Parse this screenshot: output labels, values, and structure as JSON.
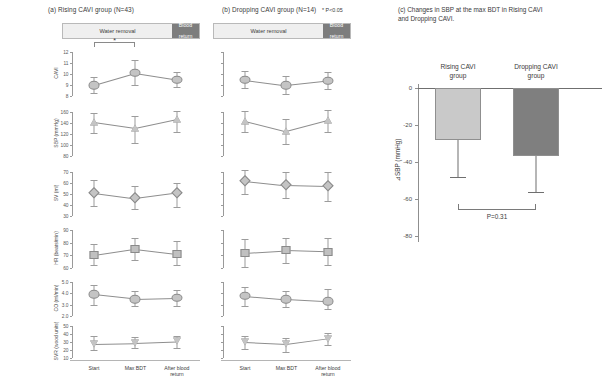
{
  "figure": {
    "panel_a_title": "(a) Rising CAVI group (N=43)",
    "panel_b_title": "(b) Dropping CAVI group (N=14)",
    "panel_c_title": "(c) Changes in SBP at the max  BDT in Rising CAVI and Dropping CAVI.",
    "significance_note": "* P<0.05",
    "phase_water_label": "Water removal",
    "phase_blood_label_line1": "Blood",
    "phase_blood_label_line2": "return",
    "sig_star": "*"
  },
  "x_labels": [
    "Start",
    "Max BDT",
    "After blood\nreturn"
  ],
  "chart_data": [
    {
      "type": "line",
      "title": "(a) Rising CAVI group (N=43)",
      "xlabel": "",
      "x": [
        "Start",
        "Max BDT",
        "After blood return"
      ],
      "grid": false,
      "legend": "none",
      "rows": [
        {
          "ylabel": "CAVI",
          "ylim": [
            8,
            12
          ],
          "ticks": [
            8,
            9,
            10,
            11,
            12
          ],
          "ticklabels": [
            "8",
            "9",
            "10",
            "11",
            "12"
          ],
          "marker": "circle",
          "values": [
            9.0,
            10.1,
            9.5
          ],
          "err_low": [
            8.3,
            9.0,
            8.8
          ],
          "err_high": [
            9.7,
            11.3,
            10.2
          ],
          "significance": {
            "from": 0,
            "to": 1,
            "label": "*"
          }
        },
        {
          "ylabel": "SBP (mmHg)",
          "ylim": [
            80,
            160
          ],
          "ticks": [
            80,
            100,
            120,
            140,
            160
          ],
          "ticklabels": [
            "80",
            "100",
            "120",
            "140",
            "160"
          ],
          "marker": "triangle",
          "values": [
            142,
            131,
            147
          ],
          "err_low": [
            121,
            104,
            124
          ],
          "err_high": [
            159,
            152,
            162
          ]
        },
        {
          "ylabel": "SV (ml)",
          "ylim": [
            30,
            70
          ],
          "ticks": [
            30,
            40,
            50,
            60,
            70
          ],
          "ticklabels": [
            "30",
            "40",
            "50",
            "60",
            "70"
          ],
          "marker": "diamond",
          "values": [
            51,
            46,
            51
          ],
          "err_low": [
            39,
            36,
            38
          ],
          "err_high": [
            63,
            57,
            60
          ]
        },
        {
          "ylabel": "HR (beats/min)",
          "ylim": [
            60,
            90
          ],
          "ticks": [
            60,
            70,
            80,
            90
          ],
          "ticklabels": [
            "60",
            "70",
            "80",
            "90"
          ],
          "marker": "square",
          "values": [
            70,
            75,
            71
          ],
          "err_low": [
            62,
            66,
            62
          ],
          "err_high": [
            79,
            84,
            81
          ]
        },
        {
          "ylabel": "CO (ml/min)",
          "ylim": [
            2.0,
            5.0
          ],
          "ticks": [
            2.0,
            3.0,
            4.0,
            5.0
          ],
          "ticklabels": [
            "2.0",
            "3.0",
            "4.0",
            "5.0"
          ],
          "marker": "circle",
          "values": [
            3.9,
            3.5,
            3.6
          ],
          "err_low": [
            3.0,
            2.9,
            2.9
          ],
          "err_high": [
            4.7,
            4.2,
            4.3
          ]
        },
        {
          "ylabel": "SVR (wood units)",
          "ylim": [
            10,
            50
          ],
          "ticks": [
            10,
            20,
            30,
            40,
            50
          ],
          "ticklabels": [
            "10",
            "20",
            "30",
            "40",
            "50"
          ],
          "marker": "down-triangle",
          "values": [
            28,
            29,
            31
          ],
          "err_low": [
            20,
            22,
            23
          ],
          "err_high": [
            37,
            36,
            38
          ]
        }
      ]
    },
    {
      "type": "line",
      "title": "(b) Dropping CAVI group (N=14)",
      "xlabel": "",
      "x": [
        "Start",
        "Max BDT",
        "After blood return"
      ],
      "grid": false,
      "legend": "none",
      "rows": [
        {
          "ylabel": "CAVI",
          "ylim": [
            8,
            12
          ],
          "ticks": [
            8,
            9,
            10,
            11,
            12
          ],
          "marker": "circle",
          "values": [
            9.5,
            9.0,
            9.4
          ],
          "err_low": [
            8.7,
            8.2,
            8.6
          ],
          "err_high": [
            10.3,
            9.8,
            10.2
          ]
        },
        {
          "ylabel": "SBP (mmHg)",
          "ylim": [
            80,
            160
          ],
          "ticks": [
            80,
            100,
            120,
            140,
            160
          ],
          "marker": "triangle",
          "values": [
            144,
            125,
            145
          ],
          "err_low": [
            123,
            101,
            124
          ],
          "err_high": [
            162,
            148,
            163
          ]
        },
        {
          "ylabel": "SV (ml)",
          "ylim": [
            30,
            70
          ],
          "ticks": [
            30,
            40,
            50,
            60,
            70
          ],
          "marker": "diamond",
          "values": [
            62,
            58,
            57
          ],
          "err_low": [
            50,
            46,
            44
          ],
          "err_high": [
            72,
            70,
            70
          ]
        },
        {
          "ylabel": "HR (beats/min)",
          "ylim": [
            60,
            90
          ],
          "ticks": [
            60,
            70,
            80,
            90
          ],
          "marker": "square",
          "values": [
            72,
            74,
            73
          ],
          "err_low": [
            61,
            64,
            62
          ],
          "err_high": [
            83,
            84,
            84
          ]
        },
        {
          "ylabel": "CO (ml/min)",
          "ylim": [
            2.0,
            5.0
          ],
          "ticks": [
            2.0,
            3.0,
            4.0,
            5.0
          ],
          "marker": "circle",
          "values": [
            3.8,
            3.5,
            3.3
          ],
          "err_low": [
            2.9,
            2.8,
            2.6
          ],
          "err_high": [
            4.6,
            4.2,
            4.4
          ]
        },
        {
          "ylabel": "SVR (wood units)",
          "ylim": [
            10,
            50
          ],
          "ticks": [
            10,
            20,
            30,
            40,
            50
          ],
          "marker": "down-triangle",
          "values": [
            29.5,
            27,
            34
          ],
          "err_low": [
            21,
            18,
            26
          ],
          "err_high": [
            38,
            35,
            41
          ]
        }
      ]
    },
    {
      "type": "bar",
      "title": "(c) Changes in SBP at the max  BDT in Rising CAVI and Dropping CAVI.",
      "categories": [
        "Rising CAVI\ngroup",
        "Dropping CAVI\ngroup"
      ],
      "values": [
        -28,
        -37
      ],
      "err_low": [
        -48,
        -56
      ],
      "ylabel": "⊿SBP (mmHg)",
      "ylim": [
        -80,
        0
      ],
      "ticks": [
        0,
        -20,
        -40,
        -60,
        -80
      ],
      "ticklabels": [
        "0",
        "-20",
        "-40",
        "-60",
        "-80"
      ],
      "grid": false,
      "legend": "none",
      "annotation": "P=0.31",
      "colors": [
        "#c9c9c9",
        "#7f7f7f"
      ]
    }
  ],
  "colors": {
    "marker_fill": "#c4c4c4",
    "marker_edge": "#8a8a8a",
    "line": "#8e8e8e",
    "bar_light": "#c9c9c9",
    "bar_dark": "#7f7f7f",
    "axis": "#9a9a9a"
  }
}
